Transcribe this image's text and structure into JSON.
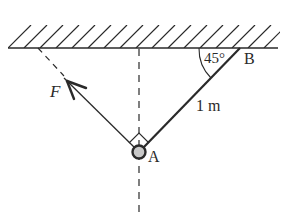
{
  "diagram": {
    "ceiling": {
      "y": 48,
      "x_start": 8,
      "x_end": 278,
      "hatch_top": 25
    },
    "points": {
      "A": {
        "label": "A",
        "x": 139,
        "y": 152
      },
      "B": {
        "label": "B",
        "x": 240,
        "y": 48
      }
    },
    "rope": {
      "from": "A",
      "to": "B",
      "length_label": "1 m"
    },
    "angle": {
      "label": "45°",
      "at": "B",
      "between": [
        "ceiling",
        "rope"
      ]
    },
    "force": {
      "label": "F",
      "direction": "perpendicular to rope, up-left"
    },
    "vertical_reference": "dashed vertical line through A",
    "colors": {
      "line": "#2a2a2a",
      "ring_fill": "#c8c8c8",
      "background": "#ffffff"
    }
  }
}
